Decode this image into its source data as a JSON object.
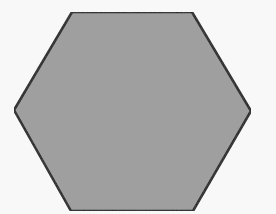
{
  "diagram": {
    "shape": "hexagon",
    "background_color": "#f8f8f8",
    "fill_color": "#9e9e9e",
    "stroke_color": "#1a1a1a",
    "stroke_width": 2.5,
    "points": "72,12 192,12 251,111 193,211 71,211 14,110"
  }
}
